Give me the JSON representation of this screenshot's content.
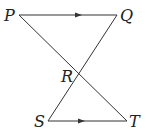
{
  "diagram": {
    "points": {
      "P": {
        "label": "P",
        "x": 19,
        "y": 15
      },
      "Q": {
        "label": "Q",
        "x": 117,
        "y": 15
      },
      "R": {
        "label": "R",
        "x": 78,
        "y": 75
      },
      "S": {
        "label": "S",
        "x": 48,
        "y": 121
      },
      "T": {
        "label": "T",
        "x": 127,
        "y": 121
      }
    },
    "segments": [
      "PQ",
      "ST",
      "PT",
      "QS"
    ],
    "parallel_marks": [
      "PQ",
      "ST"
    ],
    "colors": {
      "line": "#333333",
      "text": "#222222"
    }
  }
}
